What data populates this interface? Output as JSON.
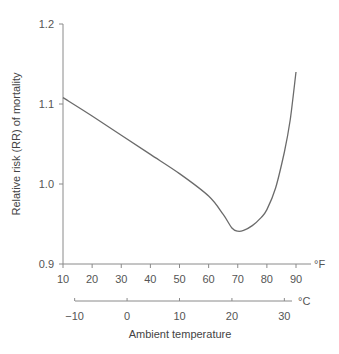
{
  "chart_data": {
    "type": "line",
    "title": "",
    "ylabel": "Relative risk (RR) of mortality",
    "xlabel": "Ambient temperature",
    "x_unit_primary": "°F",
    "x_unit_secondary": "°C",
    "ylim": [
      0.9,
      1.2
    ],
    "xlim": [
      10,
      95
    ],
    "grid": false,
    "legend": null,
    "y_ticks": [
      "0.9",
      "1.0",
      "1.1",
      "1.2"
    ],
    "x_ticks_fahrenheit": [
      "10",
      "20",
      "30",
      "40",
      "50",
      "60",
      "70",
      "80",
      "90"
    ],
    "x_ticks_celsius": [
      "−10",
      "0",
      "10",
      "20",
      "30"
    ],
    "series": [
      {
        "name": "Relative risk of mortality",
        "x": [
          10,
          20,
          30,
          40,
          50,
          60,
          65,
          68,
          70,
          72,
          75,
          78,
          80,
          83,
          86,
          88,
          90
        ],
        "y": [
          1.108,
          1.085,
          1.061,
          1.037,
          1.013,
          0.985,
          0.962,
          0.945,
          0.941,
          0.942,
          0.948,
          0.958,
          0.968,
          0.995,
          1.04,
          1.08,
          1.14
        ]
      }
    ]
  }
}
